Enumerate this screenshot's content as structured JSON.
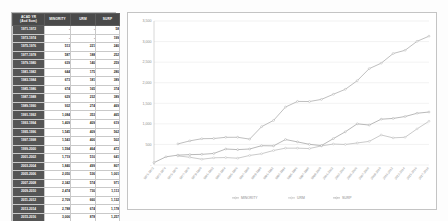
{
  "table": {
    "headers": {
      "year_line1": "ACAD YR",
      "year_line2": "(Acd Sum)",
      "minority": "MINORITY",
      "urm": "URM",
      "surp": "SURP"
    },
    "rows": [
      {
        "year": "1971-1972",
        "minority": "-",
        "urm": "-",
        "surp": "58"
      },
      {
        "year": "1973-1974",
        "minority": "-",
        "urm": "-",
        "surp": "199"
      },
      {
        "year": "1975-1976",
        "minority": "513",
        "urm": "221",
        "surp": "240"
      },
      {
        "year": "1977-1978",
        "minority": "587",
        "urm": "188",
        "surp": "252"
      },
      {
        "year": "1979-1980",
        "minority": "639",
        "urm": "140",
        "surp": "259"
      },
      {
        "year": "1981-1982",
        "minority": "644",
        "urm": "175",
        "surp": "280"
      },
      {
        "year": "1983-1984",
        "minority": "673",
        "urm": "181",
        "surp": "389"
      },
      {
        "year": "1985-1986",
        "minority": "674",
        "urm": "165",
        "surp": "374"
      },
      {
        "year": "1987-1988",
        "minority": "629",
        "urm": "232",
        "surp": "389"
      },
      {
        "year": "1989-1990",
        "minority": "932",
        "urm": "274",
        "surp": "469"
      },
      {
        "year": "1991-1992",
        "minority": "1,084",
        "urm": "353",
        "surp": "465"
      },
      {
        "year": "1993-1994",
        "minority": "1,409",
        "urm": "409",
        "surp": "619"
      },
      {
        "year": "1995-1996",
        "minority": "1,545",
        "urm": "409",
        "surp": "562"
      },
      {
        "year": "1997-1998",
        "minority": "1,543",
        "urm": "400",
        "surp": "502"
      },
      {
        "year": "1999-2000",
        "minority": "1,594",
        "urm": "464",
        "surp": "472"
      },
      {
        "year": "2001-2002",
        "minority": "1,719",
        "urm": "510",
        "surp": "641"
      },
      {
        "year": "2003-2004",
        "minority": "1,840",
        "urm": "499",
        "surp": "807"
      },
      {
        "year": "2005-2006",
        "minority": "2,050",
        "urm": "536",
        "surp": "1,001"
      },
      {
        "year": "2007-2008",
        "minority": "2,342",
        "urm": "574",
        "surp": "971"
      },
      {
        "year": "2009-2010",
        "minority": "2,474",
        "urm": "730",
        "surp": "1,113"
      },
      {
        "year": "2011-2012",
        "minority": "2,709",
        "urm": "660",
        "surp": "1,132"
      },
      {
        "year": "2013-2014",
        "minority": "2,788",
        "urm": "674",
        "surp": "1,178"
      },
      {
        "year": "2015-2016",
        "minority": "3,006",
        "urm": "878",
        "surp": "1,257"
      },
      {
        "year": "2017-2018",
        "minority": "3,131",
        "urm": "1,064",
        "surp": "1,288"
      }
    ]
  },
  "chart_data": {
    "type": "line",
    "title": "",
    "xlabel": "",
    "ylabel": "",
    "ylim": [
      0,
      3500
    ],
    "grid": true,
    "legend_position": "bottom",
    "ytick_labels": [
      "3,500",
      "3,000",
      "2,500",
      "2,000",
      "1,500",
      "1,000",
      "500",
      "-"
    ],
    "ytick_values": [
      3500,
      3000,
      2500,
      2000,
      1500,
      1000,
      500,
      0
    ],
    "categories": [
      "1971-1972",
      "1973-1974",
      "1975-1976",
      "1977-1978",
      "1979-1980",
      "1981-1982",
      "1983-1984",
      "1985-1986",
      "1987-1988",
      "1989-1990",
      "1991-1992",
      "1993-1994",
      "1995-1996",
      "1997-1998",
      "1999-2000",
      "2001-2002",
      "2003-2004",
      "2005-2006",
      "2007-2008",
      "2009-2010",
      "2011-2012",
      "2013-2014",
      "2015-2016",
      "2017-2018"
    ],
    "series": [
      {
        "name": "MINORITY",
        "color": "#a6a6a6",
        "values": [
          null,
          null,
          513,
          587,
          639,
          644,
          673,
          674,
          629,
          932,
          1084,
          1409,
          1545,
          1543,
          1594,
          1719,
          1840,
          2050,
          2342,
          2474,
          2709,
          2788,
          3006,
          3131
        ]
      },
      {
        "name": "URM",
        "color": "#b5b5b5",
        "values": [
          null,
          null,
          221,
          188,
          140,
          175,
          181,
          165,
          232,
          274,
          353,
          409,
          409,
          400,
          464,
          510,
          499,
          536,
          574,
          730,
          660,
          674,
          878,
          1064
        ]
      },
      {
        "name": "SURP",
        "color": "#9e9e9e",
        "values": [
          58,
          199,
          240,
          252,
          259,
          280,
          389,
          374,
          389,
          469,
          465,
          619,
          562,
          502,
          472,
          641,
          807,
          1001,
          971,
          1113,
          1132,
          1178,
          1257,
          1288
        ]
      }
    ]
  },
  "legend": {
    "items": [
      {
        "label": "MINORITY"
      },
      {
        "label": "URM"
      },
      {
        "label": "SURP"
      }
    ]
  }
}
